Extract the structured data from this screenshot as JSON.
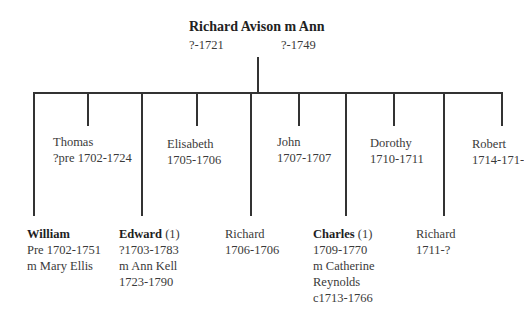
{
  "parents": {
    "title": "Richard Avison m Ann",
    "father_dates": "?-1721",
    "mother_dates": "?-1749"
  },
  "children_upper": [
    {
      "name": "Thomas",
      "dates": "?pre 1702-1724"
    },
    {
      "name": "Elisabeth",
      "dates": "1705-1706"
    },
    {
      "name": "John",
      "dates": "1707-1707"
    },
    {
      "name": "Dorothy",
      "dates": "1710-1711"
    },
    {
      "name": "Robert",
      "dates": "1714-171-"
    }
  ],
  "children_lower": [
    {
      "name": "William",
      "note": "",
      "dates": "Pre 1702-1751",
      "spouse": "m Mary Ellis",
      "spouse_cont": "",
      "spouse_dates": "",
      "bold": true
    },
    {
      "name": "Edward",
      "note": "(1)",
      "dates": "?1703-1783",
      "spouse": "m Ann Kell",
      "spouse_cont": "",
      "spouse_dates": "1723-1790",
      "bold": true
    },
    {
      "name": "Richard",
      "note": "",
      "dates": "1706-1706",
      "spouse": "",
      "spouse_cont": "",
      "spouse_dates": "",
      "bold": false
    },
    {
      "name": "Charles",
      "note": "(1)",
      "dates": "1709-1770",
      "spouse": "m Catherine",
      "spouse_cont": "Reynolds",
      "spouse_dates": "c1713-1766",
      "bold": true
    },
    {
      "name": "Richard",
      "note": "",
      "dates": "1711-?",
      "spouse": "",
      "spouse_cont": "",
      "spouse_dates": "",
      "bold": false
    }
  ],
  "colors": {
    "line": "#333333",
    "text": "#3a3a3a"
  }
}
